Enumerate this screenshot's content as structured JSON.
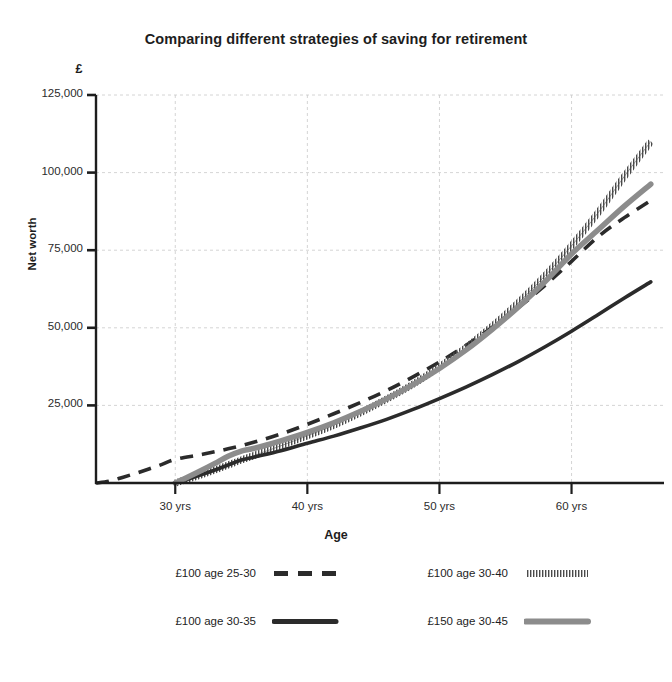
{
  "chart_data": {
    "type": "line",
    "title": "Comparing different strategies of saving for retirement",
    "xlabel": "Age",
    "ylabel": "Net worth",
    "currency_symbol": "£",
    "xlim": [
      24,
      67
    ],
    "ylim": [
      0,
      125000
    ],
    "grid": true,
    "legend_position": "below",
    "xticks": [
      30,
      40,
      50,
      60
    ],
    "xtick_labels": [
      "30 yrs",
      "40 yrs",
      "50 yrs",
      "60 yrs"
    ],
    "yticks": [
      25000,
      50000,
      75000,
      100000,
      125000
    ],
    "ytick_labels": [
      "25,000",
      "50,000",
      "75,000",
      "100,000",
      "125,000"
    ],
    "series": [
      {
        "name": "£100 age 25-30",
        "style": "dashed",
        "color": "#2b2b2b",
        "x": [
          24,
          25,
          26,
          27,
          28,
          29,
          30,
          32,
          34,
          36,
          38,
          40,
          42,
          44,
          46,
          48,
          50,
          52,
          54,
          56,
          58,
          60,
          62,
          64,
          66
        ],
        "values": [
          0,
          600,
          1800,
          3100,
          4500,
          6000,
          7600,
          9200,
          11000,
          13200,
          15800,
          18900,
          22300,
          25900,
          29800,
          34200,
          39000,
          44300,
          50200,
          56600,
          63700,
          71400,
          79300,
          85500,
          91000
        ]
      },
      {
        "name": "£100 age 30-40",
        "style": "hatched",
        "color": "#4a4a4a",
        "x": [
          30,
          31,
          32,
          33,
          34,
          35,
          36,
          38,
          40,
          42,
          44,
          46,
          48,
          50,
          52,
          54,
          56,
          58,
          60,
          62,
          64,
          66
        ],
        "values": [
          0,
          1300,
          2700,
          4200,
          5800,
          7400,
          8900,
          12000,
          15200,
          18600,
          22600,
          27000,
          31800,
          37400,
          43600,
          50500,
          58200,
          66800,
          76400,
          87000,
          98800,
          110000
        ]
      },
      {
        "name": "£100 age 30-35",
        "style": "solid",
        "color": "#2b2b2b",
        "x": [
          30,
          31,
          32,
          33,
          34,
          35,
          36,
          38,
          40,
          42,
          44,
          46,
          48,
          50,
          52,
          54,
          56,
          58,
          60,
          62,
          64,
          66
        ],
        "values": [
          0,
          1300,
          2700,
          4200,
          5800,
          7400,
          8400,
          10400,
          12800,
          15100,
          17700,
          20500,
          23700,
          27200,
          30900,
          34900,
          39200,
          43900,
          48900,
          54200,
          59600,
          64800
        ]
      },
      {
        "name": "£150 age 30-45",
        "style": "thick-grey",
        "color": "#8c8c8c",
        "x": [
          30,
          31,
          32,
          33,
          34,
          35,
          36,
          38,
          40,
          42,
          44,
          46,
          48,
          50,
          52,
          54,
          56,
          58,
          60,
          62,
          64,
          66
        ],
        "values": [
          0,
          2000,
          4100,
          6300,
          8600,
          10300,
          11200,
          13600,
          16300,
          19400,
          23000,
          27100,
          31700,
          36900,
          42800,
          49500,
          56800,
          64900,
          73800,
          81500,
          89200,
          96300
        ]
      }
    ]
  },
  "legend": {
    "items": [
      {
        "label": "£100 age 25-30",
        "style": "dashed"
      },
      {
        "label": "£100 age 30-40",
        "style": "hatched"
      },
      {
        "label": "£100 age 30-35",
        "style": "solid"
      },
      {
        "label": "£150 age 30-45",
        "style": "thick-grey"
      }
    ]
  }
}
